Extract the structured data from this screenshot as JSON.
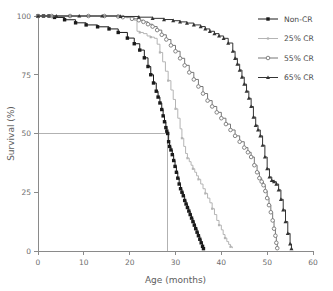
{
  "chart_data": {
    "type": "line",
    "title": "",
    "xlabel": "Age (months)",
    "ylabel": "Survival (%)",
    "xlim": [
      0,
      60
    ],
    "ylim": [
      0,
      100
    ],
    "xticks": [
      0,
      10,
      20,
      30,
      40,
      50,
      60
    ],
    "yticks": [
      0,
      25,
      50,
      75,
      100
    ],
    "grid": false,
    "legend_position": "top-right",
    "annotations": [
      {
        "name": "median-reference-line",
        "type": "hline-to-curve",
        "y": 50,
        "x_end": 28.3,
        "description": "Horizontal reference line at 50% survival meeting the Non-CR curve"
      }
    ],
    "series": [
      {
        "name": "Non-CR",
        "color": "#1a1a1a",
        "marker": "filled-square",
        "x": [
          0,
          1.2,
          2.4,
          3.6,
          5.8,
          8.2,
          10.5,
          13.0,
          15.5,
          17.5,
          19.5,
          21.0,
          22.2,
          23.2,
          24.0,
          24.6,
          25.2,
          25.8,
          26.2,
          26.6,
          27.0,
          27.3,
          27.6,
          27.9,
          28.1,
          28.3,
          28.5,
          28.7,
          29.0,
          29.3,
          29.6,
          29.9,
          30.2,
          30.5,
          30.8,
          31.1,
          31.4,
          31.7,
          32.0,
          32.3,
          32.6,
          32.9,
          33.2,
          33.5,
          33.8,
          34.1,
          34.4,
          34.7,
          35.0,
          35.3,
          35.6,
          35.9,
          36.1
        ],
        "y": [
          100,
          100,
          100,
          99.4,
          98.4,
          97.1,
          96.2,
          95.4,
          94.5,
          93.0,
          90.6,
          88.2,
          85.5,
          82.2,
          78.5,
          75.0,
          71.5,
          68.0,
          65.5,
          63.0,
          60.2,
          57.5,
          55.0,
          52.5,
          51.0,
          50.0,
          46.5,
          44.5,
          43.0,
          41.0,
          38.5,
          36.0,
          33.5,
          31.0,
          28.5,
          26.5,
          25.0,
          23.5,
          21.5,
          20.0,
          18.5,
          17.0,
          15.5,
          14.0,
          12.5,
          11.0,
          9.5,
          8.0,
          6.5,
          5.0,
          3.5,
          2.0,
          1.0
        ]
      },
      {
        "name": "25% CR",
        "color": "#b4b4b4",
        "marker": "small-tick",
        "x": [
          0,
          2.0,
          5.0,
          9.0,
          13.0,
          17.0,
          19.5,
          21.0,
          21.6,
          22.2,
          23.0,
          23.8,
          24.6,
          25.4,
          26.0,
          26.6,
          27.2,
          27.8,
          28.4,
          29.0,
          29.5,
          30.0,
          30.5,
          31.0,
          31.4,
          31.8,
          32.2,
          32.6,
          33.0,
          33.4,
          33.8,
          34.2,
          34.6,
          35.0,
          35.5,
          36.0,
          36.5,
          37.0,
          37.5,
          38.0,
          38.5,
          39.0,
          39.5,
          40.0,
          40.4,
          40.8,
          41.2,
          41.6,
          42.0,
          42.4
        ],
        "y": [
          100,
          100,
          100,
          100,
          100,
          99.8,
          99.5,
          98.2,
          93.5,
          93.0,
          92.5,
          91.5,
          91.0,
          90.5,
          88.0,
          84.5,
          80.5,
          76.5,
          72.5,
          68.5,
          64.5,
          60.5,
          56.5,
          52.0,
          48.0,
          44.5,
          41.5,
          39.5,
          38.0,
          36.5,
          35.0,
          33.5,
          32.0,
          30.5,
          28.5,
          26.5,
          24.5,
          22.5,
          20.5,
          18.0,
          15.5,
          13.0,
          11.0,
          9.0,
          7.0,
          5.5,
          4.0,
          2.8,
          1.8,
          1.2
        ]
      },
      {
        "name": "55% CR",
        "color": "#777777",
        "marker": "open-circle",
        "x": [
          0,
          3.0,
          7.0,
          11.0,
          14.5,
          17.5,
          18.5,
          20.5,
          22.0,
          23.0,
          24.0,
          25.0,
          26.0,
          27.0,
          28.0,
          29.0,
          30.0,
          31.0,
          32.0,
          33.0,
          34.0,
          35.0,
          36.0,
          37.0,
          38.0,
          39.0,
          40.0,
          41.0,
          42.0,
          43.0,
          44.0,
          45.0,
          45.8,
          46.5,
          47.2,
          47.8,
          48.3,
          48.8,
          49.2,
          49.6,
          50.0,
          50.4,
          50.8,
          51.2,
          51.5,
          51.8,
          52.0,
          52.2
        ],
        "y": [
          100,
          100,
          100,
          100,
          100,
          99.8,
          99.5,
          98.8,
          98.2,
          97.5,
          96.5,
          95.5,
          94.0,
          92.0,
          90.0,
          87.5,
          85.0,
          82.0,
          79.0,
          76.0,
          73.0,
          70.0,
          67.0,
          64.0,
          61.5,
          59.0,
          56.5,
          54.0,
          51.5,
          49.0,
          46.5,
          44.0,
          42.0,
          40.0,
          36.5,
          33.5,
          31.0,
          29.5,
          28.0,
          25.5,
          22.5,
          19.5,
          16.5,
          13.0,
          9.5,
          6.5,
          3.5,
          1.2
        ]
      },
      {
        "name": "65% CR",
        "color": "#333333",
        "marker": "filled-triangle",
        "x": [
          0,
          4.0,
          9.0,
          14.0,
          18.0,
          22.0,
          25.0,
          27.5,
          29.5,
          31.0,
          32.5,
          34.0,
          35.5,
          36.5,
          37.5,
          38.5,
          39.5,
          40.5,
          41.5,
          42.5,
          43.0,
          43.5,
          44.0,
          44.5,
          45.0,
          45.5,
          46.0,
          46.5,
          47.0,
          47.5,
          48.0,
          48.5,
          49.0,
          49.5,
          50.0,
          50.5,
          51.0,
          51.5,
          52.0,
          52.5,
          53.0,
          53.5,
          54.0,
          54.5,
          55.0,
          55.3
        ],
        "y": [
          100,
          100,
          100,
          100,
          99.8,
          99.5,
          99.0,
          98.5,
          98.0,
          97.5,
          97.0,
          96.2,
          95.5,
          94.5,
          93.5,
          92.5,
          91.5,
          90.5,
          88.5,
          85.0,
          82.0,
          79.5,
          77.0,
          74.0,
          71.0,
          68.0,
          65.0,
          61.5,
          57.0,
          53.5,
          51.5,
          49.0,
          45.0,
          40.0,
          35.0,
          31.5,
          30.0,
          29.5,
          28.5,
          26.0,
          22.0,
          17.5,
          12.5,
          7.5,
          3.0,
          1.0
        ]
      }
    ]
  },
  "legend": {
    "items": [
      {
        "label": "Non-CR"
      },
      {
        "label": "25% CR"
      },
      {
        "label": "55% CR"
      },
      {
        "label": "65% CR"
      }
    ]
  }
}
